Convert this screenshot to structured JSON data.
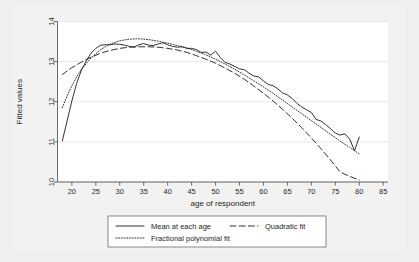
{
  "figure": {
    "background_color": "#efefef",
    "paper_color": "#f2f2f2",
    "plot_background_color": "#ffffff",
    "line_color": "#1c1c1c",
    "axis_color": "#5a5a5a",
    "grid_color": "#dedede"
  },
  "chart_data": {
    "type": "line",
    "title": "",
    "subtitle": "",
    "xlabel": "age of respondent",
    "ylabel": "Fitted values",
    "xlim": [
      17,
      86
    ],
    "ylim": [
      10,
      14
    ],
    "xticks": [
      20,
      25,
      30,
      35,
      40,
      45,
      50,
      55,
      60,
      65,
      70,
      75,
      80,
      85
    ],
    "yticks": [
      10,
      11,
      12,
      13,
      14
    ],
    "xtick_labels": [
      "20",
      "25",
      "30",
      "35",
      "40",
      "45",
      "50",
      "55",
      "60",
      "65",
      "70",
      "75",
      "80",
      "85"
    ],
    "ytick_labels": [
      "10",
      "11",
      "12",
      "13",
      "14"
    ],
    "grid": true,
    "grid_axis": "y",
    "legend_position": "below",
    "series": [
      {
        "name": "Mean at each age",
        "style": "solid",
        "x": [
          18,
          19,
          20,
          21,
          22,
          23,
          24,
          25,
          26,
          27,
          28,
          29,
          30,
          31,
          32,
          33,
          34,
          35,
          36,
          37,
          38,
          39,
          40,
          41,
          42,
          43,
          44,
          45,
          46,
          47,
          48,
          49,
          50,
          51,
          52,
          53,
          54,
          55,
          56,
          57,
          58,
          59,
          60,
          61,
          62,
          63,
          64,
          65,
          66,
          67,
          68,
          69,
          70,
          71,
          72,
          73,
          74,
          75,
          76,
          77,
          78,
          79,
          80
        ],
        "values": [
          11.02,
          11.52,
          12.02,
          12.46,
          12.79,
          13.02,
          13.21,
          13.33,
          13.41,
          13.42,
          13.42,
          13.44,
          13.43,
          13.41,
          13.38,
          13.36,
          13.42,
          13.45,
          13.41,
          13.4,
          13.44,
          13.47,
          13.42,
          13.38,
          13.36,
          13.37,
          13.33,
          13.33,
          13.3,
          13.23,
          13.24,
          13.16,
          13.26,
          13.1,
          12.98,
          12.94,
          12.88,
          12.82,
          12.8,
          12.71,
          12.64,
          12.62,
          12.52,
          12.43,
          12.4,
          12.32,
          12.22,
          12.17,
          12.08,
          11.96,
          11.87,
          11.8,
          11.73,
          11.56,
          11.52,
          11.43,
          11.33,
          11.22,
          11.17,
          11.2,
          11.07,
          10.78,
          11.12
        ]
      },
      {
        "name": "Quadratic fit",
        "style": "dashed",
        "x": [
          18,
          20,
          22,
          24,
          26,
          28,
          30,
          32,
          34,
          36,
          38,
          40,
          42,
          44,
          46,
          48,
          50,
          52,
          54,
          56,
          58,
          60,
          62,
          64,
          66,
          68,
          70,
          72,
          74,
          76,
          78,
          80
        ],
        "values": [
          12.68,
          12.85,
          12.99,
          13.11,
          13.21,
          13.28,
          13.33,
          13.36,
          13.37,
          13.37,
          13.36,
          13.33,
          13.29,
          13.23,
          13.15,
          13.06,
          12.96,
          12.84,
          12.71,
          12.56,
          12.39,
          12.21,
          12.02,
          11.81,
          11.59,
          11.35,
          11.1,
          10.83,
          10.55,
          10.25,
          10.14,
          10.05
        ]
      },
      {
        "name": "Fractional polynomial fit",
        "style": "dotted",
        "x": [
          18,
          19,
          20,
          21,
          22,
          24,
          26,
          28,
          30,
          32,
          34,
          36,
          38,
          40,
          42,
          44,
          46,
          48,
          50,
          52,
          54,
          56,
          58,
          60,
          62,
          64,
          66,
          68,
          70,
          72,
          74,
          76,
          78,
          80
        ],
        "values": [
          11.85,
          12.14,
          12.4,
          12.62,
          12.81,
          13.09,
          13.3,
          13.44,
          13.52,
          13.56,
          13.57,
          13.55,
          13.51,
          13.46,
          13.4,
          13.34,
          13.26,
          13.17,
          13.06,
          12.94,
          12.81,
          12.67,
          12.52,
          12.37,
          12.21,
          12.04,
          11.87,
          11.7,
          11.53,
          11.36,
          11.19,
          11.02,
          10.86,
          10.7
        ]
      }
    ]
  },
  "legend": {
    "entries": [
      {
        "label": "Mean at each age",
        "style": "solid"
      },
      {
        "label": "Quadratic fit",
        "style": "dashed"
      },
      {
        "label": "Fractional polynomial fit",
        "style": "dotted"
      }
    ]
  }
}
